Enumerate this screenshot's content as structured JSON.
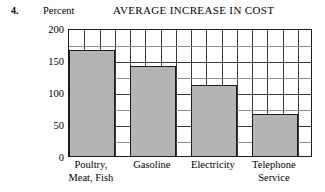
{
  "question_number": "4.",
  "chart_data": {
    "type": "bar",
    "title": "AVERAGE INCREASE IN COST",
    "ylabel": "Percent",
    "xlabel": "",
    "categories": [
      "Poultry, Meat, Fish",
      "Gasoline",
      "Electricity",
      "Telephone Service"
    ],
    "category_lines": [
      [
        "Poultry,",
        "Meat, Fish"
      ],
      [
        "Gasoline",
        ""
      ],
      [
        "Electricity",
        ""
      ],
      [
        "Telephone",
        "Service"
      ]
    ],
    "values": [
      165,
      140,
      111,
      66
    ],
    "ylim": [
      0,
      200
    ],
    "yticks": [
      0,
      50,
      100,
      150,
      200
    ],
    "ytick_labels": [
      "0",
      "50",
      "100",
      "150",
      "200"
    ],
    "minor_y_step": 25,
    "grid": true,
    "grid_columns": 16,
    "legend": "none",
    "bar_fill_color": "#b4b4b4",
    "bar_edge_color": "#1a1a1a",
    "grid_color": "#8c8c8c",
    "axis_color": "#1a1a1a"
  }
}
